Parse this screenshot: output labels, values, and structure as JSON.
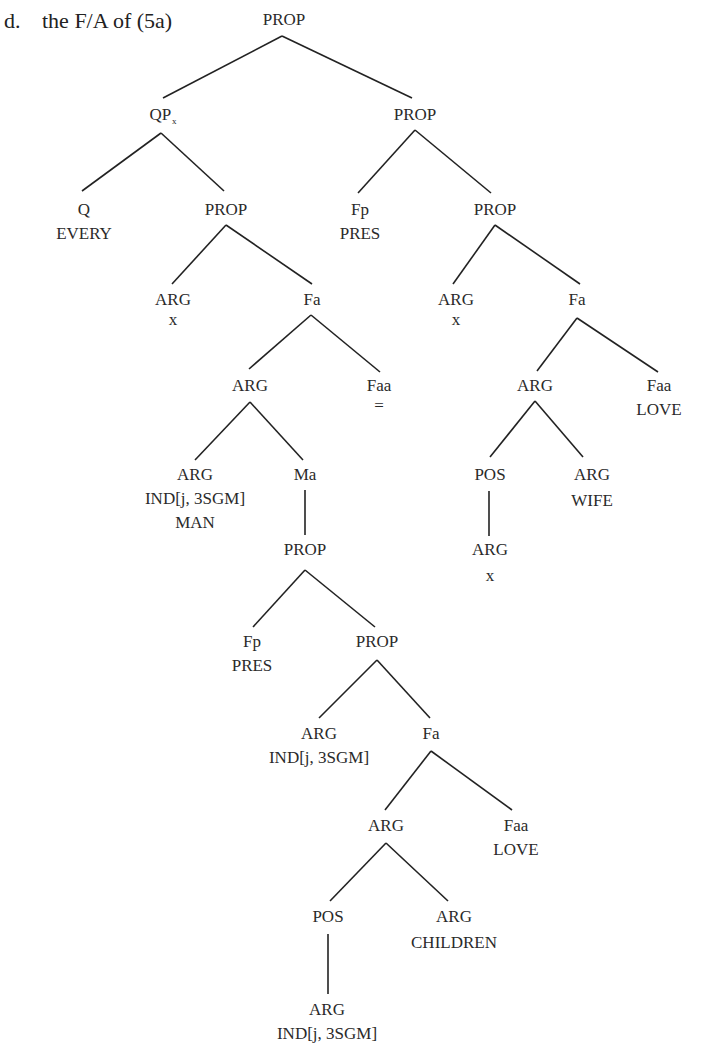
{
  "caption": {
    "item": "d.",
    "text": "the F/A of (5a)"
  },
  "tree": {
    "root": {
      "cat": "PROP"
    },
    "qp": {
      "cat": "QP",
      "sub": "x"
    },
    "q": {
      "cat": "Q",
      "val": "EVERY"
    },
    "qp_prop": {
      "cat": "PROP"
    },
    "qp_arg": {
      "cat": "ARG",
      "val": "x"
    },
    "qp_fa": {
      "cat": "Fa"
    },
    "qp_fa_arg": {
      "cat": "ARG"
    },
    "qp_faa": {
      "cat": "Faa",
      "val": "="
    },
    "man_arg": {
      "cat": "ARG",
      "val": "IND[j, 3SGM]",
      "val2": "MAN"
    },
    "ma": {
      "cat": "Ma"
    },
    "ma_prop": {
      "cat": "PROP"
    },
    "ma_fp": {
      "cat": "Fp",
      "val": "PRES"
    },
    "ma_prop2": {
      "cat": "PROP"
    },
    "ma_arg": {
      "cat": "ARG",
      "val": "IND[j, 3SGM]"
    },
    "ma_fa": {
      "cat": "Fa"
    },
    "ma_fa_arg": {
      "cat": "ARG"
    },
    "ma_faa": {
      "cat": "Faa",
      "val": "LOVE"
    },
    "ma_pos": {
      "cat": "POS"
    },
    "ma_children": {
      "cat": "ARG",
      "val": "CHILDREN"
    },
    "ma_pos_arg": {
      "cat": "ARG",
      "val": "IND[j, 3SGM]"
    },
    "r_prop": {
      "cat": "PROP"
    },
    "r_fp": {
      "cat": "Fp",
      "val": "PRES"
    },
    "r_prop2": {
      "cat": "PROP"
    },
    "r_arg": {
      "cat": "ARG",
      "val": "x"
    },
    "r_fa": {
      "cat": "Fa"
    },
    "r_fa_arg": {
      "cat": "ARG"
    },
    "r_faa": {
      "cat": "Faa",
      "val": "LOVE"
    },
    "r_pos": {
      "cat": "POS"
    },
    "r_wife": {
      "cat": "ARG",
      "val": "WIFE"
    },
    "r_pos_arg": {
      "cat": "ARG",
      "val": "x"
    }
  },
  "colors": {
    "ink": "#222222",
    "background": "#ffffff"
  }
}
